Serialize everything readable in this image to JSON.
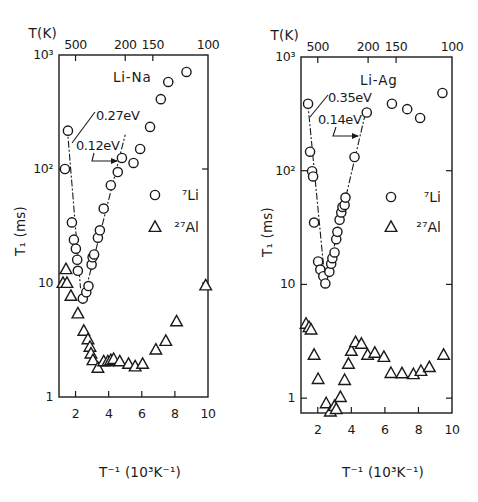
{
  "chart_data": [
    {
      "type": "scatter",
      "title": "Li-Na",
      "xlabel": "T⁻¹ (10³K⁻¹)",
      "ylabel": "T₁ (ms)",
      "top_axis_label": "T(K)",
      "xlim": [
        1,
        10
      ],
      "ylim": [
        1,
        1000
      ],
      "yscale": "log",
      "xticks": [
        2,
        4,
        6,
        8,
        10
      ],
      "xtick_labels": [
        "2",
        "4",
        "6",
        "8",
        "10"
      ],
      "yticks": [
        1,
        10,
        100,
        1000
      ],
      "ytick_labels": [
        "1",
        "10",
        "10²",
        "10³"
      ],
      "top_ticks_T": [
        500,
        200,
        150,
        100
      ],
      "top_tick_labels": [
        "500",
        "200",
        "150",
        "100"
      ],
      "grid": false,
      "legend_position": "right-middle",
      "legend": [
        {
          "marker": "circle",
          "label": "⁷Li"
        },
        {
          "marker": "triangle",
          "label": "²⁷Al"
        }
      ],
      "series": [
        {
          "name": "⁷Li",
          "marker": "circle",
          "points": [
            [
              1.36,
              100
            ],
            [
              1.54,
              217
            ],
            [
              1.78,
              34
            ],
            [
              1.9,
              24
            ],
            [
              2.02,
              20
            ],
            [
              2.1,
              16
            ],
            [
              2.14,
              12.8
            ],
            [
              2.44,
              7.3
            ],
            [
              2.65,
              8.3
            ],
            [
              2.78,
              9.4
            ],
            [
              2.97,
              14.5
            ],
            [
              3.03,
              16.8
            ],
            [
              3.12,
              17.8
            ],
            [
              3.35,
              25
            ],
            [
              3.47,
              29
            ],
            [
              3.7,
              45
            ],
            [
              4.13,
              72
            ],
            [
              4.55,
              94
            ],
            [
              4.8,
              125
            ],
            [
              5.5,
              113
            ],
            [
              5.9,
              150
            ],
            [
              6.5,
              234
            ],
            [
              7.15,
              410
            ],
            [
              7.6,
              580
            ],
            [
              8.7,
              710
            ]
          ]
        },
        {
          "name": "²⁷Al",
          "marker": "triangle",
          "points": [
            [
              1.42,
              13.2
            ],
            [
              1.24,
              10
            ],
            [
              1.48,
              10
            ],
            [
              1.72,
              7.7
            ],
            [
              2.14,
              5.4
            ],
            [
              2.5,
              3.8
            ],
            [
              2.75,
              3.2
            ],
            [
              2.87,
              2.75
            ],
            [
              2.93,
              2.4
            ],
            [
              3.05,
              2.1
            ],
            [
              3.35,
              1.8
            ],
            [
              3.7,
              2.05
            ],
            [
              3.95,
              2.05
            ],
            [
              4.13,
              2.1
            ],
            [
              4.3,
              2.15
            ],
            [
              4.67,
              2.05
            ],
            [
              5.2,
              1.95
            ],
            [
              5.6,
              1.85
            ],
            [
              6.05,
              1.95
            ],
            [
              6.85,
              2.6
            ],
            [
              7.45,
              3.1
            ],
            [
              8.1,
              4.6
            ],
            [
              9.86,
              9.5
            ]
          ]
        }
      ],
      "fits": [
        {
          "label": "0.27eV",
          "from": [
            1.5,
            230
          ],
          "to": [
            2.3,
            9
          ]
        },
        {
          "label": "0.12eV",
          "from": [
            2.45,
            7
          ],
          "to": [
            5.0,
            200
          ]
        }
      ]
    },
    {
      "type": "scatter",
      "title": "Li-Ag",
      "xlabel": "T⁻¹ (10³K⁻¹)",
      "ylabel": "T₁ (ms)",
      "top_axis_label": "T(K)",
      "xlim": [
        1,
        10
      ],
      "ylim": [
        0.74,
        1000
      ],
      "yscale": "log",
      "xticks": [
        2,
        4,
        6,
        8,
        10
      ],
      "xtick_labels": [
        "2",
        "4",
        "6",
        "8",
        "10"
      ],
      "yticks": [
        1,
        10,
        100,
        1000
      ],
      "ytick_labels": [
        "1",
        "10",
        "10²",
        "10³"
      ],
      "top_ticks_T": [
        500,
        200,
        150,
        100
      ],
      "top_tick_labels": [
        "500",
        "200",
        "150",
        "100"
      ],
      "grid": false,
      "legend_position": "right-middle",
      "legend": [
        {
          "marker": "circle",
          "label": "⁷Li"
        },
        {
          "marker": "triangle",
          "label": "²⁷Al"
        }
      ],
      "series": [
        {
          "name": "⁷Li",
          "marker": "circle",
          "points": [
            [
              1.42,
              388
            ],
            [
              1.54,
              147
            ],
            [
              1.66,
              99
            ],
            [
              1.72,
              89
            ],
            [
              1.78,
              35
            ],
            [
              2.02,
              15.9
            ],
            [
              2.15,
              13.5
            ],
            [
              2.33,
              11.8
            ],
            [
              2.45,
              10.2
            ],
            [
              2.69,
              12.9
            ],
            [
              2.8,
              15.2
            ],
            [
              2.87,
              17
            ],
            [
              3.0,
              19.1
            ],
            [
              3.1,
              25
            ],
            [
              3.17,
              29
            ],
            [
              3.3,
              37
            ],
            [
              3.4,
              43
            ],
            [
              3.47,
              48
            ],
            [
              3.6,
              50
            ],
            [
              3.65,
              58
            ],
            [
              4.19,
              132
            ],
            [
              4.92,
              325
            ],
            [
              6.42,
              388
            ],
            [
              7.33,
              348
            ],
            [
              8.1,
              291
            ],
            [
              9.43,
              483
            ]
          ]
        },
        {
          "name": "²⁷Al",
          "marker": "triangle",
          "points": [
            [
              1.3,
              4.5
            ],
            [
              1.48,
              4.2
            ],
            [
              1.6,
              4.0
            ],
            [
              1.78,
              2.4
            ],
            [
              2.02,
              1.47
            ],
            [
              2.5,
              0.9
            ],
            [
              2.75,
              0.76
            ],
            [
              3.0,
              0.85
            ],
            [
              3.1,
              0.8
            ],
            [
              3.35,
              1.02
            ],
            [
              3.6,
              1.44
            ],
            [
              3.83,
              2.0
            ],
            [
              4.0,
              2.6
            ],
            [
              4.25,
              3.1
            ],
            [
              4.6,
              3.0
            ],
            [
              4.97,
              2.4
            ],
            [
              5.4,
              2.5
            ],
            [
              5.94,
              2.3
            ],
            [
              6.36,
              1.66
            ],
            [
              7.02,
              1.65
            ],
            [
              7.7,
              1.62
            ],
            [
              8.15,
              1.73
            ],
            [
              8.65,
              1.87
            ],
            [
              9.5,
              2.4
            ]
          ]
        }
      ],
      "fits": [
        {
          "label": "0.35eV",
          "from": [
            1.4,
            400
          ],
          "to": [
            2.45,
            10
          ]
        },
        {
          "label": "0.14eV",
          "from": [
            2.45,
            10
          ],
          "to": [
            4.86,
            330
          ]
        }
      ]
    }
  ]
}
